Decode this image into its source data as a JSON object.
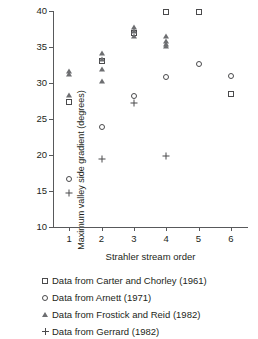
{
  "chart_data": {
    "type": "scatter",
    "title": "",
    "xlabel": "Strahler stream order",
    "ylabel": "Maximum valley side gradient (degrees)",
    "xlim": [
      0.5,
      6.5
    ],
    "ylim": [
      10,
      40
    ],
    "xticks": [
      1,
      2,
      3,
      4,
      5,
      6
    ],
    "yticks": [
      10,
      15,
      20,
      25,
      30,
      35,
      40
    ],
    "grid": false,
    "legend_position": "below",
    "series": [
      {
        "name": "Data from Carter and Chorley (1961)",
        "marker": "square",
        "points": [
          {
            "x": 1,
            "y": 27.4
          },
          {
            "x": 2,
            "y": 33.0
          },
          {
            "x": 3,
            "y": 36.9
          },
          {
            "x": 4,
            "y": 39.9
          },
          {
            "x": 5,
            "y": 39.9
          },
          {
            "x": 6,
            "y": 28.5
          }
        ]
      },
      {
        "name": "Data from Arnett (1971)",
        "marker": "circle",
        "points": [
          {
            "x": 1,
            "y": 16.7
          },
          {
            "x": 2,
            "y": 23.9
          },
          {
            "x": 3,
            "y": 28.2
          },
          {
            "x": 4,
            "y": 30.8
          },
          {
            "x": 5,
            "y": 32.7
          },
          {
            "x": 6,
            "y": 31.0
          }
        ]
      },
      {
        "name": "Data from Frostick and Reid (1982)",
        "marker": "triangle",
        "points": [
          {
            "x": 1,
            "y": 28.4
          },
          {
            "x": 1,
            "y": 31.2
          },
          {
            "x": 1,
            "y": 31.6
          },
          {
            "x": 2,
            "y": 30.3
          },
          {
            "x": 2,
            "y": 32.0
          },
          {
            "x": 2,
            "y": 33.3
          },
          {
            "x": 2,
            "y": 34.2
          },
          {
            "x": 3,
            "y": 36.5
          },
          {
            "x": 3,
            "y": 37.2
          },
          {
            "x": 3,
            "y": 37.8
          },
          {
            "x": 4,
            "y": 35.1
          },
          {
            "x": 4,
            "y": 35.4
          },
          {
            "x": 4,
            "y": 35.9
          },
          {
            "x": 4,
            "y": 36.5
          }
        ]
      },
      {
        "name": "Data from Gerrard (1982)",
        "marker": "plus",
        "points": [
          {
            "x": 1,
            "y": 14.7
          },
          {
            "x": 2,
            "y": 19.5
          },
          {
            "x": 3,
            "y": 27.2
          },
          {
            "x": 4,
            "y": 19.8
          }
        ]
      }
    ]
  },
  "axes": {
    "x_title": "Strahler stream order",
    "y_title": "Maximum valley side gradient (degrees)",
    "x_tick_labels": [
      "1",
      "2",
      "3",
      "4",
      "5",
      "6"
    ],
    "y_tick_labels": [
      "10",
      "15",
      "20",
      "25",
      "30",
      "35",
      "40"
    ]
  },
  "legend": {
    "items": [
      {
        "symbol": "square-marker",
        "label": "Data from Carter and Chorley (1961)"
      },
      {
        "symbol": "circle-marker",
        "label": "Data from Arnett (1971)"
      },
      {
        "symbol": "triangle-marker",
        "label": "Data from Frostick and Reid (1982)"
      },
      {
        "symbol": "plus-marker",
        "label": "Data from Gerrard (1982)"
      }
    ]
  },
  "colors": {
    "axis": "#58595b",
    "marker": "#4a4a4c",
    "text": "#231f20",
    "background": "#ffffff"
  }
}
